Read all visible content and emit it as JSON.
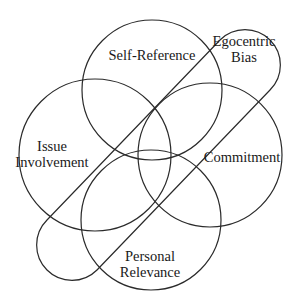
{
  "diagram": {
    "type": "venn",
    "stroke_color": "#2a2a2a",
    "circles": [
      {
        "id": "self-reference",
        "label": "Self-Reference",
        "cx": 152,
        "cy": 90,
        "r": 70,
        "label_x": 152,
        "label_y": 55
      },
      {
        "id": "issue-involvement",
        "label_line1": "Issue",
        "label_line2": "Involvement",
        "cx": 95,
        "cy": 155,
        "r": 76,
        "label_x": 52,
        "label_y": 154
      },
      {
        "id": "commitment",
        "label": "Commitment",
        "cx": 210,
        "cy": 155,
        "r": 72,
        "label_x": 242,
        "label_y": 157
      },
      {
        "id": "personal-relevance",
        "label_line1": "Personal",
        "label_line2": "Relevance",
        "cx": 151,
        "cy": 220,
        "r": 70,
        "label_x": 150,
        "label_y": 265
      }
    ],
    "stadium": {
      "id": "egocentric-bias",
      "label_line1": "Egocentric",
      "label_line2": "Bias",
      "label_x": 244,
      "label_y": 48
    }
  }
}
